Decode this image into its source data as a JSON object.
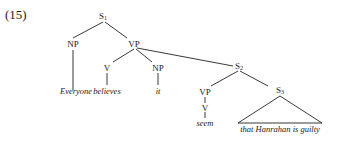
{
  "example_number": "(15)",
  "nodes": {
    "s1": {
      "label": "S",
      "sub": "1"
    },
    "np1": {
      "label": "NP"
    },
    "vp1": {
      "label": "VP"
    },
    "v1": {
      "label": "V"
    },
    "np2": {
      "label": "NP"
    },
    "s2": {
      "label": "S",
      "sub": "2"
    },
    "vp2": {
      "label": "VP"
    },
    "v2": {
      "label": "V"
    },
    "s3": {
      "label": "S",
      "sub": "3"
    }
  },
  "leaves": {
    "np1": "Everyone",
    "v1": "believes",
    "np2": "it",
    "v2": "seem",
    "s3": "that Hanrahan is guilty"
  }
}
